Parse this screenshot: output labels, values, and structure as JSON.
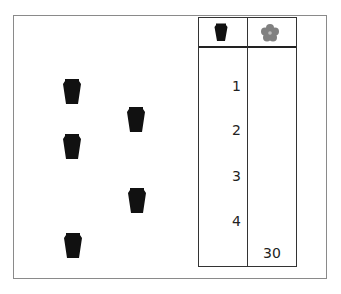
{
  "table": {
    "headers": [
      {
        "icon": "jar-icon"
      },
      {
        "icon": "flower-icon",
        "color": "#808080"
      }
    ],
    "jar_column": [
      "1",
      "2",
      "3",
      "4"
    ],
    "flower_column_total": "30"
  },
  "jars": [
    {
      "x": 63,
      "y": 78
    },
    {
      "x": 127,
      "y": 106
    },
    {
      "x": 63,
      "y": 133
    },
    {
      "x": 128,
      "y": 187
    },
    {
      "x": 64,
      "y": 232
    }
  ],
  "colors": {
    "jar": "#111111",
    "flower": "#808080",
    "frame": "#8a8a8a"
  }
}
